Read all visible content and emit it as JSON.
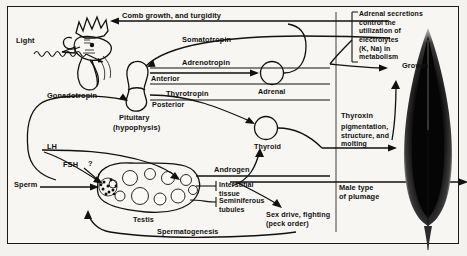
{
  "diagram": {
    "title_note": "Hormonal control diagram in a rooster (cockerel) showing pituitary, adrenal, thyroid and testis pathways",
    "border_color": "#1a1a1a",
    "background_color": "#f7f6f2",
    "ink_color": "#111111",
    "testis_fill": "#b9b7b2"
  },
  "labels": {
    "light": "Light",
    "comb_growth": "Comb growth, and turgidity",
    "somatotropin": "Somatotropin",
    "adrenotropin": "Adrenotropin",
    "anterior": "Anterior",
    "thyrotropin": "Thyrotropin",
    "posterior": "Posterior",
    "pituitary": "Pituitary",
    "hypophysis": "(hypophysis)",
    "gonadotropin": "Gonadotropin",
    "adrenal": "Adrenal",
    "thyroid": "Thyroid",
    "adrenal_note": "Adrenal secretions\ncontrol the\nutilization of\nelectrolytes\n(K, Na) in\nmetabolism",
    "growth": "Growth",
    "thyroxin": "Thyroxin",
    "thyroxin_effects": "pigmentation,\nstructure, and\nmolting",
    "lh": "LH",
    "fsh": "FSH",
    "question": "?",
    "sperm": "Sperm",
    "androgen": "Androgen",
    "interstitial_tissue": "Interstitial\ntissue",
    "seminiferous_tubules": "Seminiferous\ntubules",
    "testis": "Testis",
    "spermatogenesis": "Spermatogenesis",
    "male_plumage": "Male type\nof plumage",
    "sex_drive": "Sex drive, fighting\n(peck order)"
  }
}
